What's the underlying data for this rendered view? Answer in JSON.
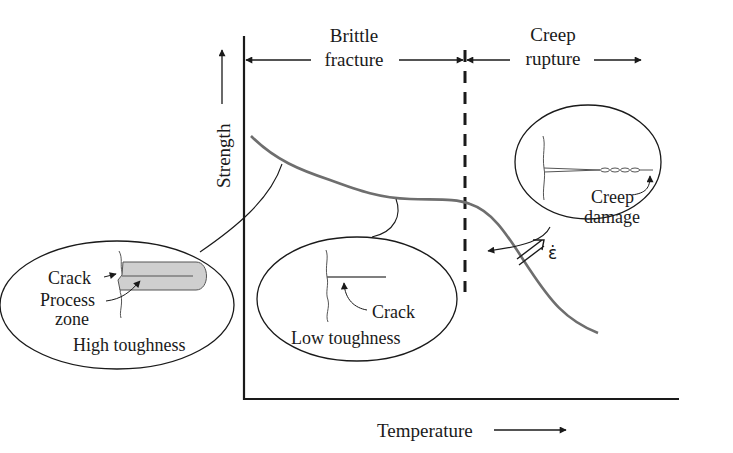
{
  "diagram": {
    "axes": {
      "y_label": "Strength",
      "x_label": "Temperature"
    },
    "regions": [
      {
        "id": "brittle",
        "line1": "Brittle",
        "line2": "fracture"
      },
      {
        "id": "creep",
        "line1": "Creep",
        "line2": "rupture"
      }
    ],
    "callouts": {
      "high_toughness": {
        "crack_label": "Crack",
        "process_label_1": "Process",
        "process_label_2": "zone",
        "title": "High toughness"
      },
      "low_toughness": {
        "crack_label": "Crack",
        "title": "Low toughness"
      },
      "creep": {
        "label_1": "Creep",
        "label_2": "damage"
      }
    },
    "strain_rate_symbol": "ε̇",
    "colors": {
      "ink": "#1a1a1a",
      "curve": "#6e6e6e",
      "process_zone_fill": "#cfcfcf"
    }
  }
}
